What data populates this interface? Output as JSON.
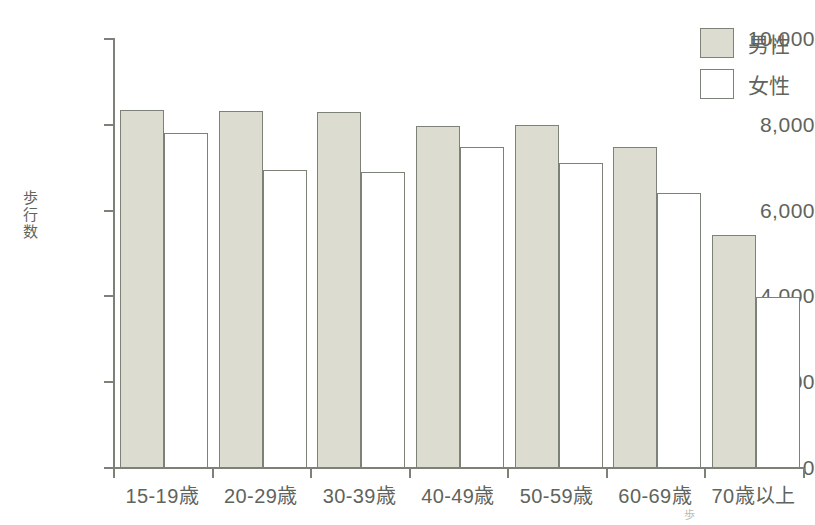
{
  "chart_data": {
    "type": "bar",
    "title": "",
    "xlabel": "",
    "ylabel": "歩行数",
    "ylim": [
      0,
      10000
    ],
    "ytick_values": [
      10000,
      8000,
      6000,
      4000,
      2000,
      0
    ],
    "ytick_labels": [
      "10,000",
      "8,000",
      "6,000",
      "4,000",
      "2,000",
      "0"
    ],
    "grid": false,
    "legend_position": "top-right",
    "categories": [
      "15-19歳",
      "20-29歳",
      "30-39歳",
      "40-49歳",
      "50-59歳",
      "60-69歳",
      "70歳以上"
    ],
    "series": [
      {
        "name": "男性",
        "color": "#dddcd1",
        "border_color": "#7d8279",
        "values": [
          8350,
          8320,
          8310,
          7970,
          8000,
          7480,
          5430
        ]
      },
      {
        "name": "女性",
        "color": "#ffffff",
        "border_color": "#7d8279",
        "values": [
          7800,
          6950,
          6900,
          7480,
          7110,
          6410,
          3990
        ]
      }
    ]
  },
  "legend": {
    "items": [
      {
        "label": "男性",
        "swatch": "male"
      },
      {
        "label": "女性",
        "swatch": "female"
      }
    ]
  },
  "axis_title": {
    "y_chars": [
      "歩",
      "行",
      "数"
    ]
  },
  "artifact": {
    "text": "歩"
  },
  "colors": {
    "bar_fill_male": "#dddcd1",
    "bar_fill_female": "#ffffff",
    "stroke": "#7d8279",
    "text": "#5f645c",
    "background": "#ffffff"
  }
}
